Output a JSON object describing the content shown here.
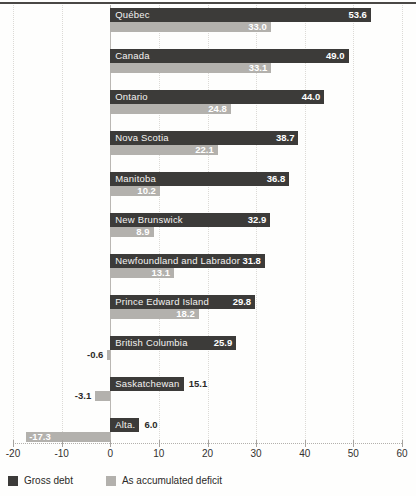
{
  "chart_data": {
    "type": "bar",
    "orientation": "horizontal",
    "categories": [
      "Québec",
      "Canada",
      "Ontario",
      "Nova Scotia",
      "Manitoba",
      "New Brunswick",
      "Newfoundland and Labrador",
      "Prince Edward Island",
      "British Columbia",
      "Saskatchewan",
      "Alta."
    ],
    "series": [
      {
        "name": "Gross debt",
        "color": "#3c3b39",
        "values": [
          53.6,
          49.0,
          44.0,
          38.7,
          36.8,
          32.9,
          31.8,
          29.8,
          25.9,
          15.1,
          6.0
        ],
        "value_placement": [
          "in",
          "in",
          "in",
          "in",
          "in",
          "in",
          "in",
          "in",
          "in",
          "out",
          "out"
        ]
      },
      {
        "name": "As accumulated deficit",
        "color": "#b3b1ad",
        "values": [
          33.0,
          33.1,
          24.8,
          22.1,
          10.2,
          8.9,
          13.1,
          18.2,
          -0.6,
          -3.1,
          -17.3
        ],
        "value_placement": [
          "in",
          "in",
          "in",
          "in",
          "in",
          "in",
          "in",
          "in",
          "out",
          "out",
          "in"
        ]
      }
    ],
    "title": "",
    "xlabel": "",
    "ylabel": "",
    "xlim": [
      -20,
      60
    ],
    "xticks": [
      -20,
      -10,
      0,
      10,
      20,
      30,
      40,
      50,
      60
    ],
    "xtick_labels": [
      "-20",
      "-10",
      "0",
      "10",
      "20",
      "30",
      "40",
      "50",
      "60"
    ],
    "grid": "dotted-vertical",
    "zero_line": true,
    "legend_position": "bottom-left",
    "value_format": "one-decimal",
    "colors": {
      "gridline": "#dcdad6",
      "zero_line": "#bab7b3",
      "axis_text": "#33312e",
      "outside_value_text": "#2b2a28",
      "inside_value_text": "#ffffff",
      "top_rule": "#4a4845"
    }
  }
}
